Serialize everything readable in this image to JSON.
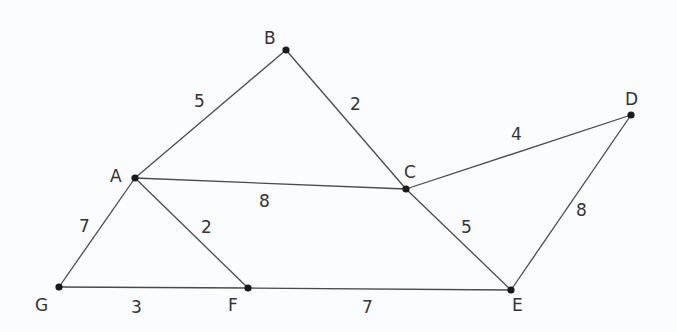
{
  "graph": {
    "nodes": [
      {
        "id": "A",
        "label": "A",
        "x": 135,
        "y": 178,
        "lx": 110,
        "ly": 182
      },
      {
        "id": "B",
        "label": "B",
        "x": 286,
        "y": 50,
        "lx": 264,
        "ly": 44
      },
      {
        "id": "C",
        "label": "C",
        "x": 406,
        "y": 189,
        "lx": 404,
        "ly": 178
      },
      {
        "id": "D",
        "label": "D",
        "x": 631,
        "y": 115,
        "lx": 625,
        "ly": 105
      },
      {
        "id": "E",
        "label": "E",
        "x": 511,
        "y": 290,
        "lx": 512,
        "ly": 311
      },
      {
        "id": "F",
        "label": "F",
        "x": 248,
        "y": 288,
        "lx": 228,
        "ly": 311
      },
      {
        "id": "G",
        "label": "G",
        "x": 59,
        "y": 287,
        "lx": 35,
        "ly": 311
      }
    ],
    "edges": [
      {
        "from": "A",
        "to": "B",
        "weight": "5",
        "lx": 194,
        "ly": 107
      },
      {
        "from": "B",
        "to": "C",
        "weight": "2",
        "lx": 350,
        "ly": 110
      },
      {
        "from": "A",
        "to": "C",
        "weight": "8",
        "lx": 259,
        "ly": 207
      },
      {
        "from": "C",
        "to": "D",
        "weight": "4",
        "lx": 511,
        "ly": 140
      },
      {
        "from": "D",
        "to": "E",
        "weight": "8",
        "lx": 576,
        "ly": 216
      },
      {
        "from": "C",
        "to": "E",
        "weight": "5",
        "lx": 461,
        "ly": 233
      },
      {
        "from": "A",
        "to": "G",
        "weight": "7",
        "lx": 79,
        "ly": 232
      },
      {
        "from": "A",
        "to": "F",
        "weight": "2",
        "lx": 201,
        "ly": 233
      },
      {
        "from": "G",
        "to": "F",
        "weight": "3",
        "lx": 131,
        "ly": 313
      },
      {
        "from": "F",
        "to": "E",
        "weight": "7",
        "lx": 362,
        "ly": 313
      }
    ]
  }
}
